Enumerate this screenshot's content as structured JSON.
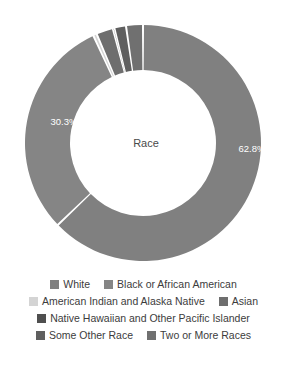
{
  "chart_data": {
    "type": "pie",
    "variant": "donut",
    "title": "Race",
    "center_label": "Race",
    "xlabel": "",
    "ylabel": "",
    "legend_position": "bottom",
    "grid": false,
    "start_angle_deg": 0,
    "direction": "clockwise",
    "geometry": {
      "center_x": 143,
      "center_y": 143,
      "outer_radius": 118,
      "inner_radius": 73,
      "slice_gap_deg": 1.0
    },
    "categories": [
      "White",
      "Black or African American",
      "American Indian and Alaska Native",
      "Asian",
      "Native Hawaiian and Other Pacific Islander",
      "Some Other Race",
      "Two or More Races"
    ],
    "values": [
      62.8,
      30.3,
      0.5,
      2.3,
      0.2,
      1.6,
      2.3
    ],
    "unit": "%",
    "colors": [
      "#808080",
      "#858585",
      "#d4d4d4",
      "#6e6e6e",
      "#4f4f4f",
      "#5f5f5f",
      "#707070"
    ],
    "data_labels": [
      {
        "category": "White",
        "text": "62.8%",
        "shown": true
      },
      {
        "category": "Black or African American",
        "text": "30.3%",
        "shown": true
      },
      {
        "category": "American Indian and Alaska Native",
        "text": "",
        "shown": false
      },
      {
        "category": "Asian",
        "text": "",
        "shown": false
      },
      {
        "category": "Native Hawaiian and Other Pacific Islander",
        "text": "",
        "shown": false
      },
      {
        "category": "Some Other Race",
        "text": "",
        "shown": false
      },
      {
        "category": "Two or More Races",
        "text": "",
        "shown": false
      }
    ]
  },
  "labels": {
    "white_pct": "62.8%",
    "black_pct": "30.3%",
    "center": "Race"
  },
  "legend": {
    "rows": [
      {
        "entries": [
          {
            "label": "White",
            "color": "#808080"
          },
          {
            "label": "Black or African American",
            "color": "#858585"
          }
        ]
      },
      {
        "entries": [
          {
            "label": "American Indian and Alaska Native",
            "color": "#d4d4d4"
          },
          {
            "label": "Asian",
            "color": "#6e6e6e"
          }
        ]
      },
      {
        "entries": [
          {
            "label": "Native Hawaiian and Other Pacific Islander",
            "color": "#4f4f4f"
          }
        ]
      },
      {
        "entries": [
          {
            "label": "Some Other Race",
            "color": "#5f5f5f"
          },
          {
            "label": "Two or More Races",
            "color": "#707070"
          }
        ]
      }
    ]
  }
}
